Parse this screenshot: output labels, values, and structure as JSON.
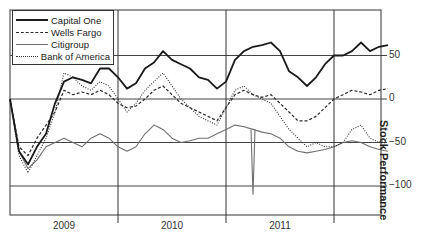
{
  "chart_data": {
    "type": "line",
    "title": "",
    "xlabel": "",
    "ylabel": "Stock Performance",
    "ylim": [
      -130,
      100
    ],
    "yticks": [
      50,
      0,
      -50,
      -100
    ],
    "ytick_labels": [
      "50",
      "0",
      "−50",
      "−100"
    ],
    "x_unit": "month index from Jan 2009",
    "x_tick_labels": [
      "2009",
      "2010",
      "2011"
    ],
    "year_dividers_month": [
      12,
      24,
      36
    ],
    "grid": true,
    "legend_position": "upper-left",
    "x": [
      0,
      1,
      2,
      3,
      4,
      5,
      6,
      7,
      8,
      9,
      10,
      11,
      12,
      13,
      14,
      15,
      16,
      17,
      18,
      19,
      20,
      21,
      22,
      23,
      24,
      25,
      26,
      27,
      28,
      29,
      30,
      31,
      32,
      33,
      34,
      35,
      36,
      37,
      38,
      39,
      40,
      41,
      42
    ],
    "series": [
      {
        "name": "Capital One",
        "style": "solid-thick",
        "color": "#1a1a1a",
        "values": [
          0,
          -60,
          -75,
          -55,
          -40,
          -5,
          20,
          25,
          22,
          18,
          35,
          35,
          25,
          12,
          18,
          35,
          42,
          55,
          45,
          40,
          35,
          25,
          22,
          12,
          20,
          45,
          55,
          60,
          62,
          65,
          55,
          32,
          25,
          15,
          25,
          40,
          50,
          50,
          55,
          65,
          55,
          60,
          62
        ]
      },
      {
        "name": "Wells Fargo",
        "style": "dashed",
        "color": "#2a2a2a",
        "values": [
          0,
          -55,
          -65,
          -45,
          -30,
          -15,
          10,
          5,
          8,
          5,
          10,
          5,
          -5,
          -10,
          -8,
          0,
          10,
          15,
          5,
          -5,
          -10,
          -15,
          -20,
          -25,
          -10,
          5,
          10,
          5,
          2,
          5,
          -5,
          -15,
          -25,
          -25,
          -20,
          -10,
          0,
          5,
          10,
          8,
          5,
          10,
          12
        ]
      },
      {
        "name": "Citigroup",
        "style": "solid-thin",
        "color": "#707070",
        "values": [
          0,
          -60,
          -80,
          -70,
          -55,
          -50,
          -45,
          -50,
          -55,
          -45,
          -40,
          -45,
          -55,
          -60,
          -55,
          -40,
          -30,
          -35,
          -45,
          -50,
          -48,
          -45,
          -45,
          -40,
          -35,
          -30,
          -32,
          -35,
          -38,
          -40,
          -45,
          -55,
          -60,
          -62,
          -60,
          -58,
          -55,
          -50,
          -48,
          -50,
          -55,
          -58,
          -60
        ]
      },
      {
        "name": "Bank of America",
        "style": "dotted",
        "color": "#333333",
        "values": [
          0,
          -65,
          -85,
          -65,
          -45,
          -15,
          30,
          25,
          15,
          10,
          20,
          15,
          0,
          -15,
          -5,
          10,
          20,
          30,
          15,
          0,
          -10,
          -20,
          -25,
          -30,
          -10,
          10,
          15,
          5,
          0,
          -5,
          -20,
          -35,
          -45,
          -55,
          -50,
          -55,
          -55,
          -50,
          -35,
          -30,
          -45,
          -50,
          -45
        ]
      }
    ]
  }
}
